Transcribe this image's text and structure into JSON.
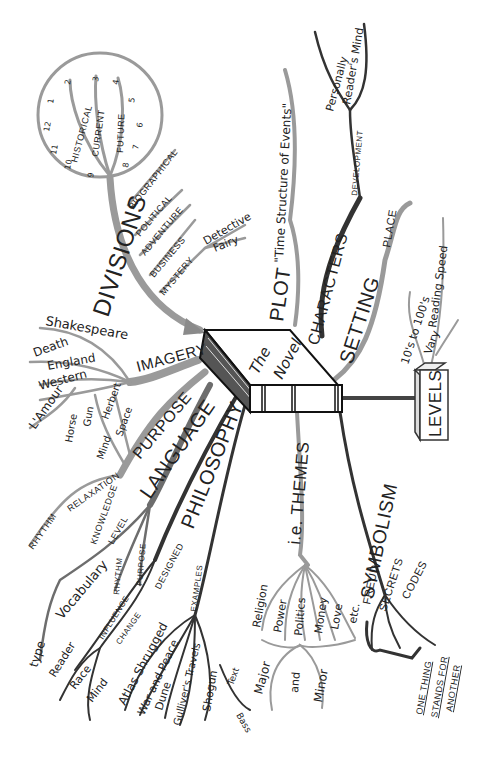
{
  "center": {
    "title_line1": "The",
    "title_line2": "Novel"
  },
  "divisions": {
    "label": "DIVISIONS",
    "clock": {
      "numbers": [
        "1",
        "2",
        "3",
        "4",
        "5",
        "6",
        "7",
        "8",
        "9",
        "10",
        "11",
        "12"
      ],
      "eras": [
        "HISTORICAL",
        "CURRENT",
        "FUTURE"
      ]
    },
    "genres": [
      "BIOGRAPHICAL",
      "POLITICAL",
      "ADVENTURE",
      "BUSINESS",
      "MYSTERY"
    ],
    "mystery_sub": [
      "Detective",
      "Fairy"
    ]
  },
  "imagery": {
    "label": "IMAGERY",
    "items": [
      "Shakespeare",
      "Death",
      "England",
      "Western",
      "L'Amour"
    ]
  },
  "purpose": {
    "label": "PURPOSE",
    "items": [
      "Horse",
      "Gun",
      "Herbert",
      "Space",
      "Mind",
      "RELAXATION",
      "RHYTHM"
    ]
  },
  "language": {
    "label": "LANGUAGE",
    "items": [
      "KNOWLEDGE",
      "LEVEL",
      "Vocabulary",
      "type",
      "RHYTHM",
      "PURPOSE"
    ]
  },
  "philosophy": {
    "label": "PHILOSOPHY",
    "designed": "DESIGNED",
    "change": "CHANGE",
    "influence": "INFLUENCE",
    "influence_items": [
      "Reader",
      "Race",
      "Mind"
    ],
    "examples_label": "EXAMPLES",
    "examples": [
      "Atlas Shrugged",
      "War and Peace",
      "Dune",
      "Gulliver's Travels",
      "Shogun"
    ],
    "shogun_sub": [
      "Text",
      "Bass"
    ]
  },
  "themes": {
    "label": "i.e. THEMES",
    "items": [
      "Religion",
      "Power",
      "Politics",
      "Money",
      "Love",
      "etc."
    ],
    "scale": [
      "Major",
      "and",
      "Minor"
    ]
  },
  "symbolism": {
    "label": "SYMBOLISM",
    "items": [
      "FREUD",
      "SECRETS",
      "CODES"
    ],
    "note": [
      "ONE THING",
      "STANDS FOR",
      "ANOTHER"
    ]
  },
  "plot": {
    "label": "PLOT",
    "definition": "\"Time Structure of Events\""
  },
  "characters": {
    "label": "CHARACTERS",
    "development": "DEVELOPMENT",
    "items": [
      "Personally",
      "Reader's Mind"
    ]
  },
  "setting": {
    "label": "SETTING",
    "items": [
      "PLACE"
    ]
  },
  "levels": {
    "label": "LEVELS",
    "items": [
      "10's to 100's",
      "Vary",
      "Reading Speed"
    ]
  },
  "colors": {
    "ink": "#222222",
    "branch_light": "#9a9a9a",
    "branch_mid": "#6d6d6d",
    "branch_dark": "#333333"
  }
}
